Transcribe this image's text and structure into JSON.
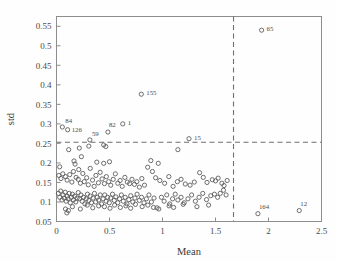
{
  "chart_data": {
    "type": "scatter",
    "title": "",
    "xlabel": "Mean",
    "ylabel": "std",
    "xlim": [
      0,
      2.5
    ],
    "ylim": [
      0.05,
      0.575
    ],
    "grid": false,
    "legend": null,
    "xticks": [
      0,
      0.5,
      1,
      1.5,
      2,
      2.5
    ],
    "xtick_labels": [
      "0",
      "0.5",
      "1",
      "1.5",
      "2",
      "2.5"
    ],
    "yticks": [
      0.05,
      0.1,
      0.15,
      0.2,
      0.25,
      0.3,
      0.35,
      0.4,
      0.45,
      0.5,
      0.55
    ],
    "ytick_labels": [
      "0.05",
      "0.1",
      "0.15",
      "0.2",
      "0.25",
      "0.3",
      "0.35",
      "0.4",
      "0.45",
      "0.5",
      "0.55"
    ],
    "marker": "open-circle",
    "marker_color": "#555555",
    "threshold_lines": [
      {
        "orientation": "vertical",
        "value": 1.67,
        "style": "dashed",
        "color": "#6f6f6f"
      },
      {
        "orientation": "horizontal",
        "value": 0.253,
        "style": "dashed",
        "color": "#6f6f6f"
      }
    ],
    "annotations": [
      {
        "label": "84",
        "x": 0.055,
        "y": 0.292,
        "dx": 3,
        "dy": -4
      },
      {
        "label": "126",
        "x": 0.105,
        "y": 0.285,
        "dx": 4,
        "dy": 2
      },
      {
        "label": "59",
        "x": 0.315,
        "y": 0.259,
        "dx": 2,
        "dy": -4
      },
      {
        "label": "82",
        "x": 0.485,
        "y": 0.279,
        "dx": 1,
        "dy": -5
      },
      {
        "label": "1",
        "x": 0.625,
        "y": 0.3,
        "dx": 5,
        "dy": 1
      },
      {
        "label": "155",
        "x": 0.8,
        "y": 0.376,
        "dx": 5,
        "dy": 1
      },
      {
        "label": "15",
        "x": 1.25,
        "y": 0.262,
        "dx": 5,
        "dy": 1
      },
      {
        "label": "65",
        "x": 1.935,
        "y": 0.54,
        "dx": 5,
        "dy": 1
      },
      {
        "label": "164",
        "x": 1.9,
        "y": 0.07,
        "dx": 1,
        "dy": -5
      },
      {
        "label": "12",
        "x": 2.29,
        "y": 0.078,
        "dx": 1,
        "dy": -5
      }
    ],
    "points": [
      [
        0.055,
        0.292
      ],
      [
        0.105,
        0.285
      ],
      [
        0.315,
        0.259
      ],
      [
        0.485,
        0.279
      ],
      [
        0.625,
        0.3
      ],
      [
        0.8,
        0.376
      ],
      [
        1.25,
        0.262
      ],
      [
        1.935,
        0.54
      ],
      [
        1.9,
        0.07
      ],
      [
        2.29,
        0.078
      ],
      [
        0.115,
        0.234
      ],
      [
        0.215,
        0.238
      ],
      [
        0.305,
        0.243
      ],
      [
        0.445,
        0.246
      ],
      [
        0.465,
        0.242
      ],
      [
        1.145,
        0.234
      ],
      [
        0.03,
        0.19
      ],
      [
        0.165,
        0.205
      ],
      [
        0.235,
        0.216
      ],
      [
        0.175,
        0.197
      ],
      [
        0.21,
        0.183
      ],
      [
        0.38,
        0.202
      ],
      [
        0.445,
        0.199
      ],
      [
        0.5,
        0.203
      ],
      [
        0.89,
        0.206
      ],
      [
        0.96,
        0.199
      ],
      [
        0.022,
        0.168
      ],
      [
        0.042,
        0.16
      ],
      [
        0.06,
        0.172
      ],
      [
        0.085,
        0.165
      ],
      [
        0.1,
        0.156
      ],
      [
        0.125,
        0.17
      ],
      [
        0.145,
        0.151
      ],
      [
        0.16,
        0.178
      ],
      [
        0.185,
        0.163
      ],
      [
        0.205,
        0.158
      ],
      [
        0.225,
        0.148
      ],
      [
        0.248,
        0.173
      ],
      [
        0.262,
        0.152
      ],
      [
        0.285,
        0.162
      ],
      [
        0.3,
        0.144
      ],
      [
        0.318,
        0.186
      ],
      [
        0.34,
        0.156
      ],
      [
        0.355,
        0.14
      ],
      [
        0.372,
        0.168
      ],
      [
        0.395,
        0.149
      ],
      [
        0.412,
        0.176
      ],
      [
        0.43,
        0.159
      ],
      [
        0.452,
        0.147
      ],
      [
        0.47,
        0.165
      ],
      [
        0.492,
        0.152
      ],
      [
        0.512,
        0.143
      ],
      [
        0.535,
        0.158
      ],
      [
        0.555,
        0.172
      ],
      [
        0.578,
        0.148
      ],
      [
        0.6,
        0.155
      ],
      [
        0.62,
        0.14
      ],
      [
        0.645,
        0.163
      ],
      [
        0.668,
        0.151
      ],
      [
        0.69,
        0.147
      ],
      [
        0.712,
        0.158
      ],
      [
        0.735,
        0.145
      ],
      [
        0.758,
        0.152
      ],
      [
        0.782,
        0.138
      ],
      [
        0.805,
        0.16
      ],
      [
        0.83,
        0.143
      ],
      [
        0.86,
        0.189
      ],
      [
        0.905,
        0.178
      ],
      [
        0.935,
        0.162
      ],
      [
        0.975,
        0.155
      ],
      [
        1.02,
        0.148
      ],
      [
        1.06,
        0.165
      ],
      [
        1.1,
        0.14
      ],
      [
        1.14,
        0.152
      ],
      [
        1.175,
        0.158
      ],
      [
        1.215,
        0.146
      ],
      [
        1.26,
        0.143
      ],
      [
        1.3,
        0.151
      ],
      [
        1.35,
        0.175
      ],
      [
        1.385,
        0.163
      ],
      [
        1.42,
        0.15
      ],
      [
        1.47,
        0.157
      ],
      [
        1.5,
        0.154
      ],
      [
        1.525,
        0.161
      ],
      [
        1.56,
        0.148
      ],
      [
        1.58,
        0.142
      ],
      [
        1.61,
        0.155
      ],
      [
        0.018,
        0.122
      ],
      [
        0.03,
        0.112
      ],
      [
        0.04,
        0.128
      ],
      [
        0.052,
        0.105
      ],
      [
        0.062,
        0.118
      ],
      [
        0.072,
        0.11
      ],
      [
        0.082,
        0.125
      ],
      [
        0.092,
        0.102
      ],
      [
        0.1,
        0.115
      ],
      [
        0.11,
        0.108
      ],
      [
        0.12,
        0.122
      ],
      [
        0.13,
        0.098
      ],
      [
        0.14,
        0.112
      ],
      [
        0.15,
        0.12
      ],
      [
        0.16,
        0.105
      ],
      [
        0.172,
        0.115
      ],
      [
        0.182,
        0.1
      ],
      [
        0.195,
        0.11
      ],
      [
        0.205,
        0.124
      ],
      [
        0.218,
        0.108
      ],
      [
        0.23,
        0.118
      ],
      [
        0.242,
        0.102
      ],
      [
        0.255,
        0.112
      ],
      [
        0.268,
        0.095
      ],
      [
        0.28,
        0.108
      ],
      [
        0.292,
        0.12
      ],
      [
        0.305,
        0.104
      ],
      [
        0.318,
        0.115
      ],
      [
        0.33,
        0.098
      ],
      [
        0.345,
        0.11
      ],
      [
        0.358,
        0.122
      ],
      [
        0.37,
        0.1
      ],
      [
        0.385,
        0.112
      ],
      [
        0.398,
        0.105
      ],
      [
        0.412,
        0.118
      ],
      [
        0.425,
        0.095
      ],
      [
        0.44,
        0.108
      ],
      [
        0.455,
        0.118
      ],
      [
        0.468,
        0.102
      ],
      [
        0.482,
        0.112
      ],
      [
        0.498,
        0.098
      ],
      [
        0.512,
        0.11
      ],
      [
        0.528,
        0.12
      ],
      [
        0.545,
        0.104
      ],
      [
        0.56,
        0.113
      ],
      [
        0.578,
        0.098
      ],
      [
        0.595,
        0.108
      ],
      [
        0.612,
        0.118
      ],
      [
        0.63,
        0.102
      ],
      [
        0.648,
        0.112
      ],
      [
        0.665,
        0.095
      ],
      [
        0.682,
        0.106
      ],
      [
        0.7,
        0.116
      ],
      [
        0.72,
        0.1
      ],
      [
        0.74,
        0.11
      ],
      [
        0.76,
        0.12
      ],
      [
        0.782,
        0.104
      ],
      [
        0.802,
        0.112
      ],
      [
        0.825,
        0.098
      ],
      [
        0.848,
        0.108
      ],
      [
        0.872,
        0.118
      ],
      [
        0.895,
        0.1
      ],
      [
        0.92,
        0.11
      ],
      [
        0.948,
        0.085
      ],
      [
        0.965,
        0.082
      ],
      [
        0.99,
        0.112
      ],
      [
        1.015,
        0.102
      ],
      [
        1.04,
        0.118
      ],
      [
        1.068,
        0.095
      ],
      [
        1.095,
        0.108
      ],
      [
        1.12,
        0.12
      ],
      [
        1.145,
        0.105
      ],
      [
        1.175,
        0.112
      ],
      [
        1.205,
        0.098
      ],
      [
        1.24,
        0.108
      ],
      [
        1.275,
        0.118
      ],
      [
        1.31,
        0.102
      ],
      [
        1.345,
        0.112
      ],
      [
        1.38,
        0.122
      ],
      [
        1.415,
        0.106
      ],
      [
        1.455,
        0.116
      ],
      [
        1.49,
        0.12
      ],
      [
        1.52,
        0.112
      ],
      [
        1.545,
        0.122
      ],
      [
        1.575,
        0.13
      ],
      [
        1.6,
        0.118
      ],
      [
        0.085,
        0.082
      ],
      [
        0.098,
        0.072
      ],
      [
        0.112,
        0.078
      ],
      [
        0.15,
        0.088
      ],
      [
        0.225,
        0.082
      ],
      [
        0.29,
        0.092
      ],
      [
        0.342,
        0.085
      ],
      [
        0.398,
        0.09
      ],
      [
        0.452,
        0.088
      ],
      [
        0.505,
        0.084
      ],
      [
        0.548,
        0.092
      ],
      [
        0.602,
        0.086
      ],
      [
        0.655,
        0.09
      ],
      [
        0.7,
        0.084
      ],
      [
        0.745,
        0.094
      ],
      [
        0.808,
        0.088
      ],
      [
        0.862,
        0.092
      ],
      [
        0.915,
        0.086
      ],
      [
        1.062,
        0.09
      ],
      [
        1.105,
        0.086
      ],
      [
        1.195,
        0.094
      ],
      [
        1.325,
        0.088
      ],
      [
        1.435,
        0.092
      ]
    ]
  }
}
